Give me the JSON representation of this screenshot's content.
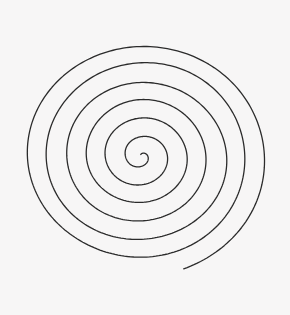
{
  "canvas": {
    "width": 290,
    "height": 315,
    "background_color": "#f7f6f6",
    "title": "spiral-drawing"
  },
  "drawing": {
    "name": "archimedean-spiral",
    "description": "Hand-drawn single-stroke archimedean spiral",
    "stroke_color": "#2b2b2b",
    "stroke_width": 1.3,
    "fill": "none",
    "style": "hand-drawn",
    "center": {
      "x": 141,
      "y": 156
    },
    "inner_end": {
      "x": 138,
      "y": 152
    },
    "outer_end": {
      "x": 155,
      "y": 23
    },
    "bounds": {
      "left": 17,
      "right": 266,
      "top": 24,
      "bottom": 296
    },
    "turns": 6.45,
    "arm_spacing_px": 19.6,
    "x_radius_scale": 1.0,
    "y_radius_scale": 0.93,
    "rotation_deg": -90,
    "direction": "counter-clockwise-outward",
    "jitter_amplitude": 1.05
  },
  "chart_data": {
    "type": "line",
    "title": "",
    "xlabel": "",
    "ylabel": "",
    "grid": false,
    "legend": "none",
    "series": [
      {
        "name": "spiral",
        "parametric": true,
        "formula": "r(t) = a + b*t",
        "a": 1.5,
        "b": 3.12,
        "t_range_rad": [
          0,
          40.5
        ],
        "cx": 141,
        "cy": 156,
        "x_scale": 1.0,
        "y_scale": 0.93
      }
    ]
  }
}
